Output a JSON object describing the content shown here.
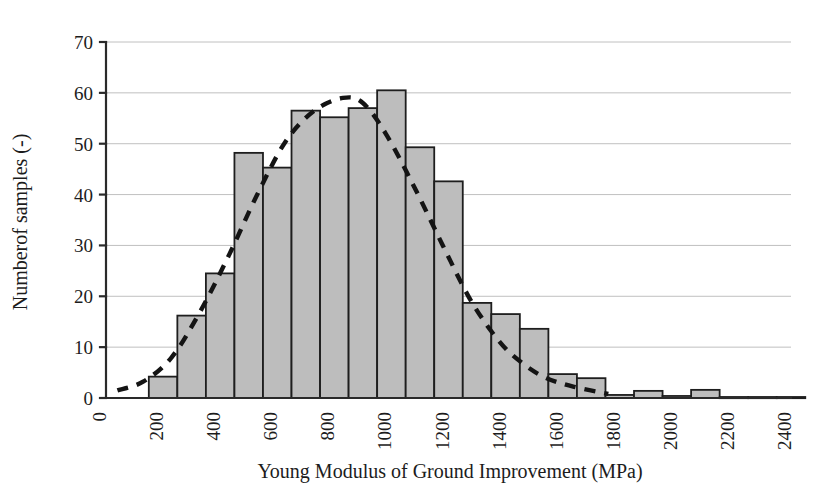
{
  "chart_data": {
    "type": "bar",
    "title": "",
    "subtitle": "",
    "xlabel": "Young Modulus of Ground Improvement (MPa)",
    "ylabel": "Numberof samples (-)",
    "xlim": [
      0,
      2400
    ],
    "ylim": [
      0,
      70
    ],
    "xticks": [
      0,
      200,
      400,
      600,
      800,
      1000,
      1200,
      1400,
      1600,
      1800,
      2000,
      2200,
      2400
    ],
    "xtick_labels": [
      "0",
      "200",
      "400",
      "600",
      "800",
      "1000",
      "1200",
      "1400",
      "1600",
      "1800",
      "2000",
      "2200",
      "2400"
    ],
    "yticks": [
      0,
      10,
      20,
      30,
      40,
      50,
      60,
      70
    ],
    "ytick_labels": [
      "0",
      "10",
      "20",
      "30",
      "40",
      "50",
      "60",
      "70"
    ],
    "grid": "horizontal",
    "legend": "none",
    "bin_width": 100,
    "bin_starts": [
      150,
      250,
      350,
      450,
      550,
      650,
      750,
      850,
      950,
      1050,
      1150,
      1250,
      1350,
      1450,
      1550,
      1650,
      1750,
      1850,
      1950,
      2050,
      2150,
      2250,
      2350
    ],
    "categories": [
      "150",
      "250",
      "350",
      "450",
      "550",
      "650",
      "750",
      "850",
      "950",
      "1050",
      "1150",
      "1250",
      "1350",
      "1450",
      "1550",
      "1650",
      "1750",
      "1850",
      "1950",
      "2050",
      "2150",
      "2250",
      "2350"
    ],
    "values": [
      4.2,
      16.2,
      24.5,
      48.2,
      45.3,
      56.5,
      55.2,
      57.0,
      60.5,
      49.3,
      42.6,
      18.7,
      16.5,
      13.6,
      4.7,
      3.9,
      0.6,
      1.4,
      0.4,
      1.6,
      0.2,
      0.2,
      0.2
    ],
    "series": [
      {
        "name": "Number of samples",
        "type": "bar",
        "color": "#bdbdbd",
        "edge_color": "#1e1e1e",
        "values": [
          4.2,
          16.2,
          24.5,
          48.2,
          45.3,
          56.5,
          55.2,
          57.0,
          60.5,
          49.3,
          42.6,
          18.7,
          16.5,
          13.6,
          4.7,
          3.9,
          0.6,
          1.4,
          0.4,
          1.6,
          0.2,
          0.2,
          0.2
        ]
      },
      {
        "name": "Fitted distribution",
        "type": "line",
        "style": "dashed",
        "color": "#141414",
        "x": [
          40,
          130,
          230,
          330,
          430,
          530,
          630,
          730,
          830,
          900,
          980,
          1080,
          1180,
          1280,
          1380,
          1460,
          1540,
          1640,
          1760
        ],
        "values": [
          1.5,
          3.2,
          8.0,
          17.0,
          28.0,
          40.0,
          50.5,
          56.5,
          59.0,
          58.0,
          52.0,
          41.5,
          30.0,
          19.0,
          11.0,
          6.8,
          4.0,
          2.2,
          0.8
        ]
      }
    ]
  },
  "axes": {
    "x_title": "Young Modulus of Ground Improvement (MPa)",
    "y_title": "Numberof samples (-)"
  }
}
